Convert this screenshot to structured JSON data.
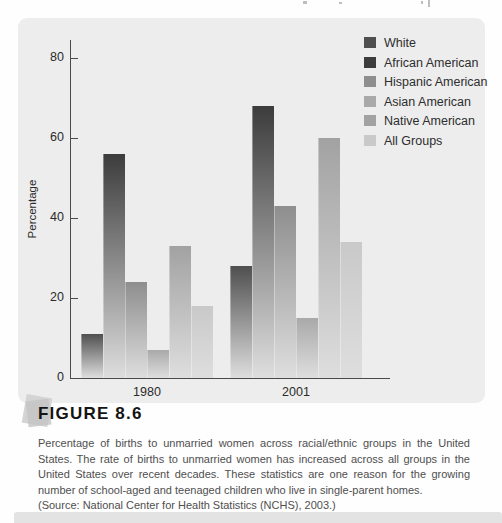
{
  "figure": {
    "label": "FIGURE 8.6",
    "caption": "Percentage of births to unmarried women across racial/ethnic groups in the United States. The rate of births to unmarried women has increased across all groups in the United States over recent decades. These statistics are one reason for the growing number of school-aged and teenaged children who live in single-parent homes.",
    "source": "(Source: National Center for Health Statistics (NCHS), 2003.)"
  },
  "chart_data": {
    "type": "bar",
    "title": "",
    "categories": [
      "1980",
      "2001"
    ],
    "series": [
      {
        "name": "White",
        "values": [
          11,
          28
        ],
        "color": "#4f4f4f"
      },
      {
        "name": "African American",
        "values": [
          56,
          68
        ],
        "color": "#3c3c3c"
      },
      {
        "name": "Hispanic American",
        "values": [
          24,
          43
        ],
        "color": "#8e8e8e"
      },
      {
        "name": "Asian American",
        "values": [
          7,
          15
        ],
        "color": "#a9a9a9"
      },
      {
        "name": "Native American",
        "values": [
          33,
          60
        ],
        "color": "#a2a2a2"
      },
      {
        "name": "All Groups",
        "values": [
          18,
          34
        ],
        "color": "#c9c9c9"
      }
    ],
    "xlabel": "",
    "ylabel": "Percentage",
    "ylim": [
      0,
      85
    ],
    "yticks": [
      0,
      20,
      40,
      60,
      80
    ],
    "grid": false,
    "legend_position": "top-right",
    "bar_style": "vertical gradient fading toward pale gray at the baseline",
    "fade_color": "#dedede",
    "panel_background": "#ededed"
  }
}
